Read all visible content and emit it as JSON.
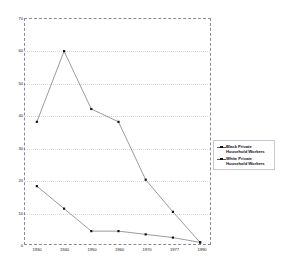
{
  "chart_data": {
    "type": "line",
    "title": "",
    "subtitle": "",
    "xlabel": "",
    "ylabel": "",
    "grid": true,
    "legend_position": "right",
    "categories": [
      "1930",
      "1940",
      "1950",
      "1960",
      "1970",
      "1977",
      "1990"
    ],
    "x": [
      "1930",
      "1940",
      "1950",
      "1960",
      "1970",
      "1977",
      "1990"
    ],
    "ylim": [
      0,
      70
    ],
    "yticks": [
      0,
      10,
      20,
      30,
      40,
      50,
      60,
      70
    ],
    "ytick_labels": [
      "0",
      "10",
      "20",
      "30",
      "40",
      "50",
      "60",
      "70"
    ],
    "xtick_labels": [
      "1930",
      "1940",
      "1950",
      "1960",
      "1970",
      "1977",
      "1990"
    ],
    "series": [
      {
        "name": "Black Private Household Workers",
        "marker": "square",
        "values": [
          38,
          60,
          42,
          38,
          20,
          10,
          0.5
        ]
      },
      {
        "name": "White Private Household Workers",
        "marker": "square",
        "values": [
          18,
          11,
          4,
          4,
          3,
          2,
          0.5
        ]
      }
    ],
    "colors": {
      "line": "#555560",
      "marker": "#111118",
      "grid": "#d8d8e2",
      "frame": "#8a8a9a"
    }
  },
  "legend": {
    "items": [
      {
        "label": "Black Private Household Workers"
      },
      {
        "label": "White Private Household Workers"
      }
    ]
  }
}
